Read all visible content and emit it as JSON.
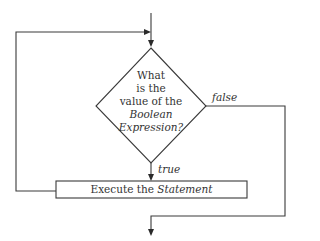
{
  "diagram": {
    "type": "flowchart",
    "title": "",
    "decision": {
      "lines": [
        "What",
        "is the",
        "value of the",
        "Boolean",
        "Expression?"
      ],
      "italic_lines": [
        3,
        4
      ]
    },
    "process": {
      "prefix": "Execute the ",
      "emphasis": "Statement"
    },
    "edges": {
      "true_label": "true",
      "false_label": "false"
    },
    "colors": {
      "stroke": "#3a3a3a",
      "text": "#333333",
      "background": "#ffffff"
    }
  }
}
